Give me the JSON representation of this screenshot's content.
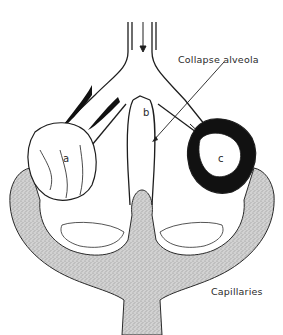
{
  "diagram": {
    "labels": {
      "collapse": "Collapse alveola",
      "capillaries": "Capillaries"
    },
    "alveoli": {
      "a": "a",
      "b": "b",
      "c": "c"
    },
    "colors": {
      "ink": "#1e1e1e",
      "stipple": "#c9c9c9",
      "stipple_dark": "#9a9a9a",
      "background": "#ffffff"
    }
  }
}
